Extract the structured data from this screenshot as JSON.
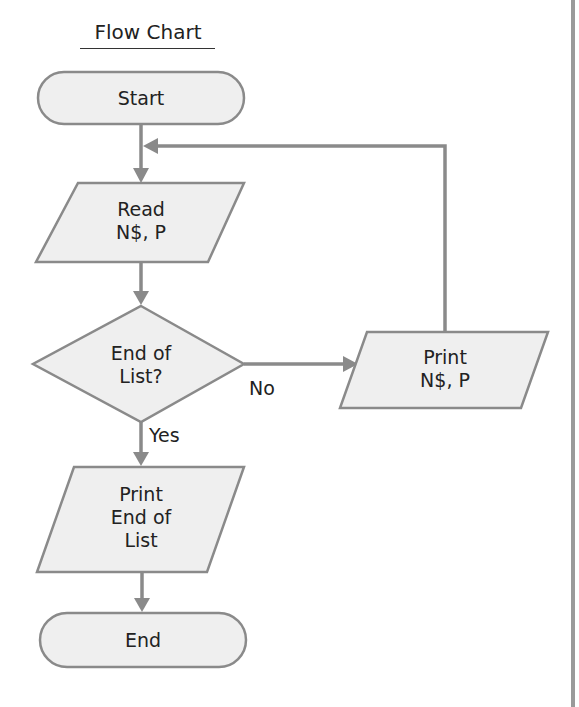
{
  "title": "Flow Chart",
  "nodes": {
    "start": {
      "type": "terminator",
      "label": "Start"
    },
    "read": {
      "type": "io",
      "line1": "Read",
      "line2": "N$, P"
    },
    "decision": {
      "type": "decision",
      "line1": "End of",
      "line2": "List?"
    },
    "print_item": {
      "type": "io",
      "line1": "Print",
      "line2": "N$, P"
    },
    "print_end": {
      "type": "io",
      "line1": "Print",
      "line2": "End of",
      "line3": "List"
    },
    "end": {
      "type": "terminator",
      "label": "End"
    }
  },
  "edges": {
    "no_label": "No",
    "yes_label": "Yes"
  },
  "flow": [
    [
      "start",
      "read"
    ],
    [
      "read",
      "decision"
    ],
    [
      "decision",
      "print_item",
      "No"
    ],
    [
      "print_item",
      "read"
    ],
    [
      "decision",
      "print_end",
      "Yes"
    ],
    [
      "print_end",
      "end"
    ]
  ],
  "colors": {
    "stroke": "#8a8a8a",
    "fill": "#efefef",
    "text": "#222222"
  }
}
